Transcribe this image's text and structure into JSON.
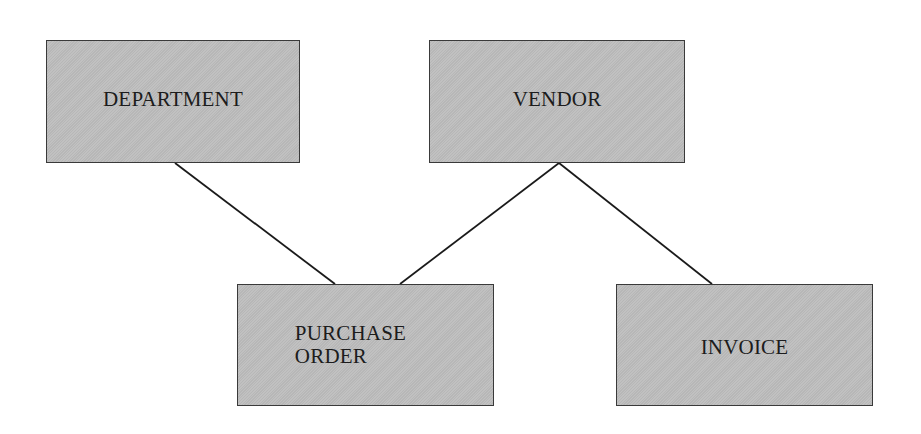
{
  "diagram": {
    "type": "entity-relationship",
    "entities": [
      {
        "id": "department",
        "label": "DEPARTMENT"
      },
      {
        "id": "vendor",
        "label": "VENDOR"
      },
      {
        "id": "purchase_order",
        "label": "PURCHASE\nORDER"
      },
      {
        "id": "invoice",
        "label": "INVOICE"
      }
    ],
    "relationships": [
      {
        "from": "department",
        "to": "purchase_order"
      },
      {
        "from": "vendor",
        "to": "purchase_order"
      },
      {
        "from": "vendor",
        "to": "invoice"
      }
    ],
    "colors": {
      "box_fill": "#bdbdbd",
      "box_border": "#3a3a3a",
      "line": "#1a1a1a",
      "text": "#1c1c1c",
      "background": "#ffffff"
    }
  }
}
